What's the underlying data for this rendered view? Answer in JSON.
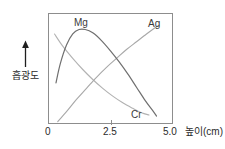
{
  "figure": {
    "watermark_text": "",
    "background_color": "#ffffff",
    "frame_color": "#8d8d8d"
  },
  "axes": {
    "y_title": "흡광도",
    "y_arrow_icon": "up-arrow-icon",
    "x_title": "높이(cm)",
    "x_ticks": [
      "0",
      "2.5",
      "5.0"
    ]
  },
  "series_labels": {
    "mg": "Mg",
    "ag": "Ag",
    "cr": "Cr"
  },
  "chart_data": {
    "type": "line",
    "title": "",
    "xlabel": "높이(cm)",
    "ylabel": "흡광도",
    "xlim": [
      0,
      5.0
    ],
    "ylim": [
      0,
      1
    ],
    "xticks": [
      0,
      2.5,
      5.0
    ],
    "xticklabels": [
      "0",
      "2.5",
      "5.0"
    ],
    "yticks": [],
    "yticklabels": [],
    "grid": false,
    "legend": "inline-labels",
    "annotations": [
      {
        "text": "Mg",
        "x": 1.15,
        "y": 0.93
      },
      {
        "text": "Ag",
        "x": 4.15,
        "y": 0.92
      },
      {
        "text": "Cr",
        "x": 3.45,
        "y": 0.07
      }
    ],
    "series": [
      {
        "name": "Mg",
        "color": "#6f6f6f",
        "x": [
          0.28,
          0.45,
          0.7,
          0.95,
          1.2,
          1.45,
          1.75,
          2.1,
          2.45,
          2.8,
          3.15,
          3.5,
          3.85,
          4.15,
          4.3
        ],
        "values": [
          0.38,
          0.55,
          0.72,
          0.82,
          0.86,
          0.86,
          0.83,
          0.76,
          0.67,
          0.57,
          0.46,
          0.34,
          0.22,
          0.13,
          0.08
        ]
      },
      {
        "name": "Ag",
        "color": "#a8a8a8",
        "x": [
          0.35,
          0.7,
          1.1,
          1.5,
          1.9,
          2.3,
          2.7,
          3.1,
          3.5,
          3.9,
          4.2,
          4.4
        ],
        "values": [
          0.03,
          0.12,
          0.23,
          0.33,
          0.43,
          0.52,
          0.6,
          0.68,
          0.75,
          0.82,
          0.87,
          0.9
        ]
      },
      {
        "name": "Cr",
        "color": "#b2b2b2",
        "x": [
          0.22,
          0.55,
          0.95,
          1.35,
          1.75,
          2.15,
          2.55,
          2.95,
          3.35,
          3.7,
          4.0
        ],
        "values": [
          0.82,
          0.71,
          0.6,
          0.5,
          0.41,
          0.33,
          0.26,
          0.2,
          0.15,
          0.11,
          0.09
        ]
      }
    ]
  }
}
